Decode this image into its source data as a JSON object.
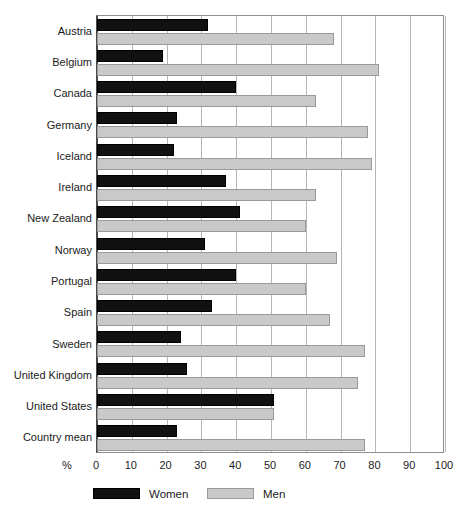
{
  "chart_data": {
    "type": "bar",
    "orientation": "horizontal",
    "title": "",
    "subtitle": "",
    "xlabel": "%",
    "ylabel": "",
    "xlim": [
      0,
      100
    ],
    "xticks": [
      0,
      10,
      20,
      30,
      40,
      50,
      60,
      70,
      80,
      90,
      100
    ],
    "xtick_labels": [
      "0",
      "10",
      "20",
      "30",
      "40",
      "50",
      "60",
      "70",
      "80",
      "90",
      "100"
    ],
    "grid": true,
    "grid_axis": "x",
    "legend_position": "bottom",
    "categories": [
      "Austria",
      "Belgium",
      "Canada",
      "Germany",
      "Iceland",
      "Ireland",
      "New Zealand",
      "Norway",
      "Portugal",
      "Spain",
      "Sweden",
      "United Kingdom",
      "United States",
      "Country mean"
    ],
    "series": [
      {
        "name": "Women",
        "color": "#111111",
        "values": [
          32,
          19,
          40,
          23,
          22,
          37,
          41,
          31,
          40,
          33,
          24,
          26,
          51,
          23
        ]
      },
      {
        "name": "Men",
        "color": "#c9c9c9",
        "values": [
          68,
          81,
          63,
          78,
          79,
          63,
          60,
          69,
          60,
          67,
          77,
          75,
          51,
          77
        ]
      }
    ]
  },
  "axis": {
    "unit_label": "%"
  },
  "legend": {
    "items": [
      {
        "label": "Women",
        "swatch": "women-swatch"
      },
      {
        "label": "Men",
        "swatch": "men-swatch"
      }
    ]
  }
}
